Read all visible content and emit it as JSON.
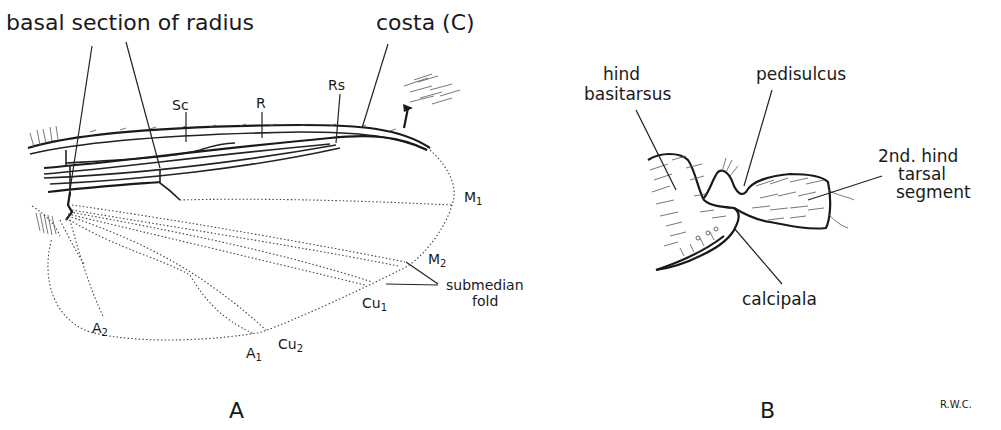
{
  "figure": {
    "panel_a": {
      "panel_label": "A",
      "labels": {
        "basal_section_of_radius": "basal section of radius",
        "costa": "costa (C)",
        "sc": "Sc",
        "r": "R",
        "rs": "Rs",
        "m1": "M",
        "m1_sub": "1",
        "m2": "M",
        "m2_sub": "2",
        "cu1": "Cu",
        "cu1_sub": "1",
        "cu2": "Cu",
        "cu2_sub": "2",
        "a1": "A",
        "a1_sub": "1",
        "a2": "A",
        "a2_sub": "2",
        "submedian_line1": "submedian",
        "submedian_line2": "fold"
      }
    },
    "panel_b": {
      "panel_label": "B",
      "labels": {
        "hind_line1": "hind",
        "hind_line2": "basitarsus",
        "pedisulcus": "pedisulcus",
        "second_line1": "2nd. hind",
        "second_line2": "tarsal",
        "second_line3": "segment",
        "calcipala": "calcipala"
      }
    },
    "credit": "R.W.C."
  }
}
